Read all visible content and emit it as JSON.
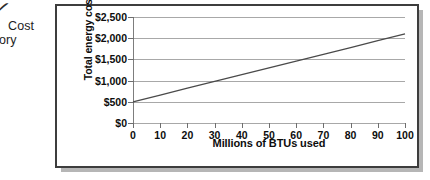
{
  "margin_notes": {
    "tick_glyph": "✓",
    "line1": "Cost",
    "line2": "ory"
  },
  "chart_data": {
    "type": "line",
    "title": "",
    "xlabel": "Millions of BTUs used",
    "ylabel": "Total energy cost",
    "xlim": [
      0,
      100
    ],
    "ylim": [
      0,
      2500
    ],
    "grid": true,
    "legend": false,
    "x_ticks": [
      0,
      10,
      20,
      30,
      40,
      50,
      60,
      70,
      80,
      90,
      100
    ],
    "x_tick_labels": [
      "0",
      "10",
      "20",
      "30",
      "40",
      "50",
      "60",
      "70",
      "80",
      "90",
      "100"
    ],
    "y_ticks": [
      0,
      500,
      1000,
      1500,
      2000,
      2500
    ],
    "y_tick_labels": [
      "$0",
      "$500",
      "$1,000",
      "$1,500",
      "$2,000",
      "$2,500"
    ],
    "series": [
      {
        "name": "Total energy cost",
        "color": "#4a4a4a",
        "x": [
          0,
          10,
          20,
          30,
          40,
          50,
          60,
          70,
          80,
          90,
          100
        ],
        "values": [
          500,
          660,
          820,
          980,
          1140,
          1300,
          1460,
          1620,
          1780,
          1940,
          2100
        ]
      }
    ]
  },
  "colors": {
    "frame": "#3d3d3d",
    "shadow": "#b6b6b6",
    "gridline": "#a8a8a8",
    "axis": "#7d7d7d",
    "line": "#4a4a4a",
    "text": "#0d0d0d"
  }
}
